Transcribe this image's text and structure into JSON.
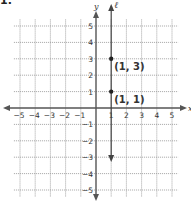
{
  "problem": {
    "number": "1."
  },
  "chart_data": {
    "type": "scatter",
    "title": "",
    "xlabel": "x",
    "ylabel": "y",
    "xlim": [
      -5,
      5
    ],
    "ylim": [
      -5,
      5
    ],
    "grid": true,
    "x_ticks": [
      -5,
      -4,
      -3,
      -2,
      -1,
      1,
      2,
      3,
      4,
      5
    ],
    "y_ticks": [
      5,
      4,
      3,
      2,
      1,
      -1,
      -2,
      -3,
      -4,
      -5
    ],
    "points": [
      {
        "x": 1,
        "y": 3,
        "label": "(1, 3)"
      },
      {
        "x": 1,
        "y": 1,
        "label": "(1, 1)"
      }
    ],
    "lines": [
      {
        "type": "vertical",
        "x": 1,
        "y_from": 6,
        "y_to": -3.3,
        "label": "ℓ",
        "arrows": "both"
      }
    ],
    "colors": {
      "axis": "#555555",
      "grid": "#9a9a9a",
      "line": "#444444",
      "point": "#222222",
      "text": "#333333"
    }
  }
}
